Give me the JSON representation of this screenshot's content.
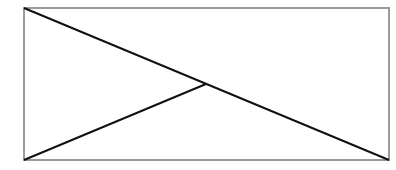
{
  "diagram": {
    "frame": {
      "x": 24,
      "y": 8,
      "width": 365,
      "height": 152,
      "stroke": "#9a9a9a",
      "stroke_width": 2
    },
    "lines": [
      {
        "name": "diagonal-top-left-to-bottom-right",
        "x1": 24,
        "y1": 8,
        "x2": 389,
        "y2": 160,
        "stroke": "#111111",
        "stroke_width": 2
      },
      {
        "name": "line-bottom-left-to-center",
        "x1": 24,
        "y1": 160,
        "x2": 206,
        "y2": 84,
        "stroke": "#111111",
        "stroke_width": 2
      }
    ]
  }
}
